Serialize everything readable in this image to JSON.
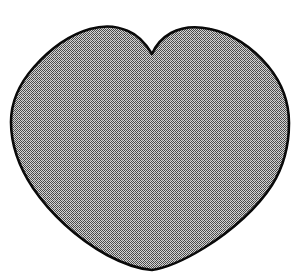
{
  "document": {
    "title": "HEART PATTERN",
    "background_color": "#ffffff"
  },
  "figure": {
    "name": "heart-pattern-outline",
    "shape": "heart",
    "outline_color": "#0a0a0a",
    "outline_width_px": 2.6,
    "fill_style": "halftone-dither-checkerboard",
    "fill_tone_color": "#8e8e8e",
    "fill_dot_color": "#4a4a4a",
    "fill_base_color": "#d2d2d2",
    "canvas": {
      "width": 298,
      "height": 273
    },
    "geometry": {
      "notch_point": [
        152,
        54
      ],
      "bottom_point": [
        152,
        270
      ],
      "left_lobe_apex": [
        101,
        27
      ],
      "right_lobe_apex": [
        210,
        29
      ],
      "widest_left_x": 11,
      "widest_right_x": 289,
      "widest_y": 122
    }
  }
}
